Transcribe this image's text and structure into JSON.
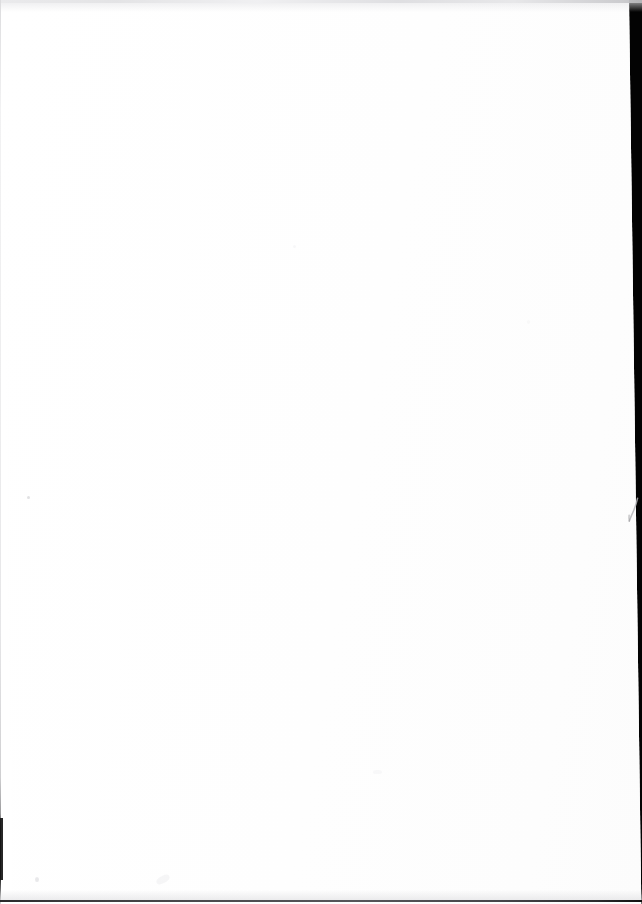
{
  "document": {
    "kind": "scanned-page",
    "page_state": "blank",
    "visible_text": "",
    "width_px": 642,
    "height_px": 904
  },
  "colors": {
    "paper": "#ffffff",
    "scanner_background": "#030303",
    "top_edge_line": "#e2e2e4",
    "left_edge_line": "#ededee",
    "bottom_edge_line": "#4a4a4d",
    "left_edge_dark_segment": "#141414",
    "margin_stroke": "#b4b4b7",
    "dust_speck": "#c9c9cc"
  },
  "regions": {
    "paper_sheet": {
      "name": "paper-sheet",
      "left_px": 0,
      "top_px": 0,
      "width_px": 629,
      "height_px": 904,
      "skew_deg": 0.78
    },
    "scanner_background_band": {
      "name": "scanner-background",
      "edge": "right",
      "top_width_px": 14,
      "bottom_width_px": 26
    }
  },
  "artifacts": {
    "margin_stroke": {
      "name": "pen-stroke-artifact",
      "shape": "hook",
      "left_px": 627,
      "top_px": 497,
      "width_px": 12,
      "height_px": 26
    },
    "dust_specks_count": 6,
    "edges": {
      "top": "thin light gray scan edge",
      "left": "thin light gray scan edge with dark lower segment",
      "bottom": "thin dark gray scan edge"
    }
  }
}
